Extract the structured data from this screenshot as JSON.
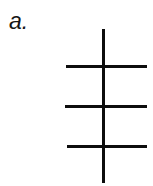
{
  "figure": {
    "panel_label": "a.",
    "background_color": "#ffffff",
    "ink_color": "#0d0d0d",
    "width": 153,
    "height": 186,
    "vertical_lines": [
      {
        "name": "main-vertical-stroke",
        "x": 102,
        "y_start": 29,
        "y_end": 183,
        "thickness": 3
      }
    ],
    "horizontal_lines": [
      {
        "name": "top-horizontal-stroke",
        "x_start": 66,
        "x_end": 147,
        "y": 65,
        "thickness": 3
      },
      {
        "name": "middle-horizontal-stroke",
        "x_start": 65,
        "x_end": 147,
        "y": 105,
        "thickness": 3
      },
      {
        "name": "bottom-horizontal-stroke",
        "x_start": 67,
        "x_end": 147,
        "y": 145,
        "thickness": 3
      }
    ]
  }
}
